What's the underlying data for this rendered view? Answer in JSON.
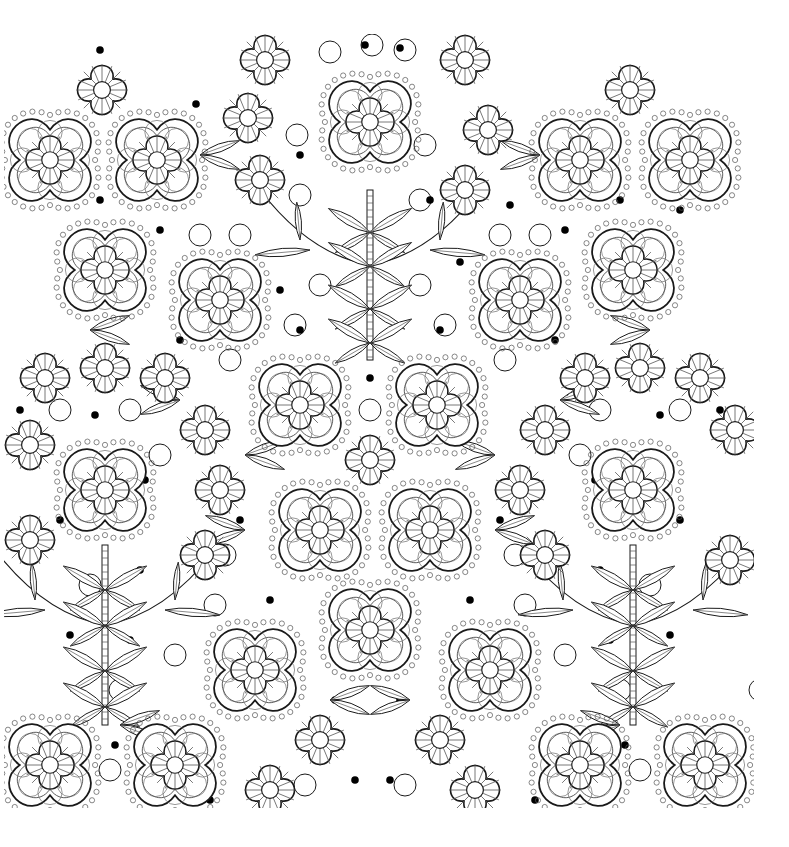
{
  "artwork": {
    "title": "Floral coloring page pattern",
    "background": "#ffffff",
    "ink": "#1a1a1a",
    "thin_ink": "#555555",
    "frame": {
      "x": 4,
      "y": 34,
      "w": 750,
      "h": 774
    },
    "large_flowers": [
      [
        50,
        160
      ],
      [
        157,
        160
      ],
      [
        370,
        122
      ],
      [
        580,
        160
      ],
      [
        690,
        160
      ],
      [
        105,
        270
      ],
      [
        220,
        300
      ],
      [
        520,
        300
      ],
      [
        633,
        270
      ],
      [
        300,
        405
      ],
      [
        437,
        405
      ],
      [
        105,
        490
      ],
      [
        320,
        530
      ],
      [
        430,
        530
      ],
      [
        633,
        490
      ],
      [
        370,
        630
      ],
      [
        255,
        670
      ],
      [
        490,
        670
      ],
      [
        50,
        765
      ],
      [
        175,
        765
      ],
      [
        580,
        765
      ],
      [
        705,
        765
      ]
    ],
    "small_flowers": [
      [
        102,
        90
      ],
      [
        265,
        60
      ],
      [
        248,
        118
      ],
      [
        260,
        180
      ],
      [
        465,
        60
      ],
      [
        488,
        130
      ],
      [
        465,
        190
      ],
      [
        630,
        90
      ],
      [
        45,
        378
      ],
      [
        105,
        368
      ],
      [
        165,
        378
      ],
      [
        205,
        430
      ],
      [
        545,
        430
      ],
      [
        585,
        378
      ],
      [
        640,
        368
      ],
      [
        700,
        378
      ],
      [
        735,
        430
      ],
      [
        30,
        445
      ],
      [
        370,
        460
      ],
      [
        220,
        490
      ],
      [
        520,
        490
      ],
      [
        205,
        555
      ],
      [
        545,
        555
      ],
      [
        30,
        540
      ],
      [
        730,
        560
      ],
      [
        320,
        740
      ],
      [
        440,
        740
      ],
      [
        270,
        790
      ],
      [
        475,
        790
      ]
    ],
    "stems": [
      {
        "x": 370,
        "y1": 190,
        "y2": 360,
        "branch_y": 265
      },
      {
        "x": 105,
        "y1": 545,
        "y2": 725,
        "branch_y": 625
      },
      {
        "x": 633,
        "y1": 545,
        "y2": 725,
        "branch_y": 625
      }
    ],
    "circles": [
      [
        330,
        52
      ],
      [
        372,
        45
      ],
      [
        405,
        50
      ],
      [
        297,
        135
      ],
      [
        300,
        195
      ],
      [
        425,
        145
      ],
      [
        420,
        200
      ],
      [
        240,
        235
      ],
      [
        200,
        235
      ],
      [
        500,
        235
      ],
      [
        540,
        235
      ],
      [
        320,
        285
      ],
      [
        420,
        285
      ],
      [
        295,
        325
      ],
      [
        445,
        325
      ],
      [
        230,
        360
      ],
      [
        505,
        360
      ],
      [
        130,
        410
      ],
      [
        600,
        410
      ],
      [
        60,
        410
      ],
      [
        680,
        410
      ],
      [
        160,
        455
      ],
      [
        580,
        455
      ],
      [
        370,
        410
      ],
      [
        225,
        555
      ],
      [
        515,
        555
      ],
      [
        90,
        585
      ],
      [
        650,
        585
      ],
      [
        215,
        605
      ],
      [
        525,
        605
      ],
      [
        175,
        655
      ],
      [
        565,
        655
      ],
      [
        120,
        690
      ],
      [
        620,
        690
      ],
      [
        305,
        785
      ],
      [
        405,
        785
      ],
      [
        110,
        770
      ],
      [
        640,
        770
      ],
      [
        760,
        690
      ]
    ],
    "dots": [
      [
        100,
        50
      ],
      [
        196,
        104
      ],
      [
        300,
        155
      ],
      [
        365,
        45
      ],
      [
        400,
        48
      ],
      [
        430,
        200
      ],
      [
        510,
        205
      ],
      [
        100,
        200
      ],
      [
        160,
        230
      ],
      [
        565,
        230
      ],
      [
        620,
        200
      ],
      [
        680,
        210
      ],
      [
        280,
        290
      ],
      [
        460,
        262
      ],
      [
        220,
        320
      ],
      [
        530,
        320
      ],
      [
        180,
        340
      ],
      [
        555,
        340
      ],
      [
        300,
        330
      ],
      [
        440,
        330
      ],
      [
        370,
        378
      ],
      [
        370,
        442
      ],
      [
        95,
        415
      ],
      [
        20,
        410
      ],
      [
        660,
        415
      ],
      [
        720,
        410
      ],
      [
        145,
        480
      ],
      [
        595,
        480
      ],
      [
        240,
        520
      ],
      [
        500,
        520
      ],
      [
        140,
        570
      ],
      [
        600,
        570
      ],
      [
        60,
        520
      ],
      [
        680,
        520
      ],
      [
        270,
        600
      ],
      [
        470,
        600
      ],
      [
        70,
        635
      ],
      [
        670,
        635
      ],
      [
        130,
        640
      ],
      [
        610,
        640
      ],
      [
        335,
        700
      ],
      [
        400,
        700
      ],
      [
        115,
        745
      ],
      [
        625,
        745
      ],
      [
        210,
        800
      ],
      [
        535,
        800
      ],
      [
        355,
        780
      ],
      [
        390,
        780
      ]
    ],
    "leaf_pairs": [
      [
        200,
        155,
        1
      ],
      [
        540,
        155,
        -1
      ],
      [
        90,
        330,
        1
      ],
      [
        650,
        330,
        -1
      ],
      [
        180,
        400,
        -1
      ],
      [
        560,
        400,
        1
      ],
      [
        245,
        455,
        1
      ],
      [
        495,
        455,
        -1
      ],
      [
        245,
        530,
        -1
      ],
      [
        495,
        530,
        1
      ],
      [
        330,
        700,
        1
      ],
      [
        410,
        700,
        -1
      ],
      [
        120,
        725,
        1
      ],
      [
        620,
        725,
        -1
      ]
    ]
  }
}
